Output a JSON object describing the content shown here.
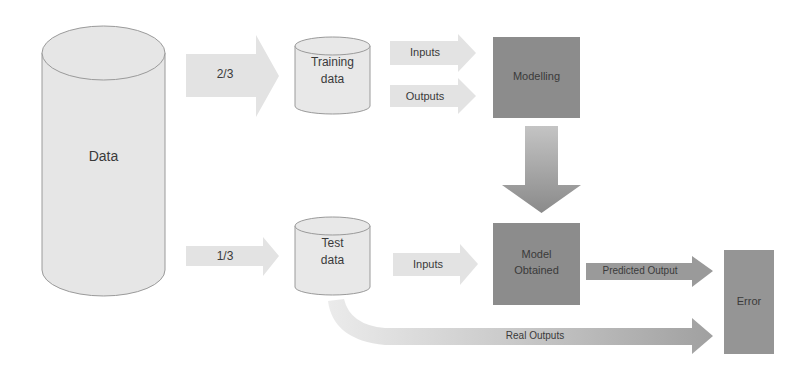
{
  "diagram": {
    "title": "",
    "colors": {
      "light_fill": "#e6e6e6",
      "light_stroke": "#9a9a9a",
      "dark_box": "#8c8c8c",
      "mid_arrow": "#a8a8a8",
      "text": "#3a3a3a"
    },
    "nodes": {
      "data": {
        "label": "Data",
        "shape": "cylinder"
      },
      "training_data": {
        "label_line1": "Training",
        "label_line2": "data",
        "shape": "cylinder"
      },
      "test_data": {
        "label_line1": "Test",
        "label_line2": "data",
        "shape": "cylinder"
      },
      "modelling": {
        "label": "Modelling",
        "shape": "box"
      },
      "model_obtained": {
        "label_line1": "Model",
        "label_line2": "Obtained",
        "shape": "box"
      },
      "error": {
        "label": "Error",
        "shape": "box"
      }
    },
    "edges": {
      "split_train": {
        "label": "2/3",
        "from": "data",
        "to": "training_data"
      },
      "split_test": {
        "label": "1/3",
        "from": "data",
        "to": "test_data"
      },
      "train_inputs": {
        "label": "Inputs",
        "from": "training_data",
        "to": "modelling"
      },
      "train_outputs": {
        "label": "Outputs",
        "from": "training_data",
        "to": "modelling"
      },
      "model_down": {
        "label": "",
        "from": "modelling",
        "to": "model_obtained"
      },
      "test_inputs": {
        "label": "Inputs",
        "from": "test_data",
        "to": "model_obtained"
      },
      "predicted": {
        "label": "Predicted Output",
        "from": "model_obtained",
        "to": "error"
      },
      "real": {
        "label": "Real Outputs",
        "from": "test_data",
        "to": "error"
      }
    }
  }
}
